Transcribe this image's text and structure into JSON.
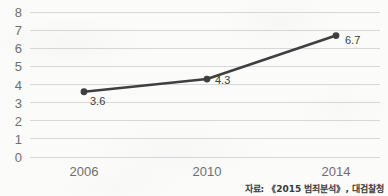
{
  "chart_data": {
    "type": "line",
    "title": "",
    "subtitle": "",
    "xlabel": "",
    "ylabel": "",
    "categories": [
      "2006",
      "2010",
      "2014"
    ],
    "values": [
      3.6,
      4.3,
      6.7
    ],
    "point_labels": [
      "3.6",
      "4.3",
      "6.7"
    ],
    "ylim": [
      0,
      8
    ],
    "ytick_labels": [
      "0",
      "1",
      "2",
      "3",
      "4",
      "5",
      "6",
      "7",
      "8"
    ],
    "ytick_values": [
      0,
      1,
      2,
      3,
      4,
      5,
      6,
      7,
      8
    ],
    "grid": true,
    "grid_axis": "y",
    "legend": false,
    "legend_position": "none",
    "series": [
      {
        "name": "",
        "values": [
          3.6,
          4.3,
          6.7
        ]
      }
    ],
    "annotations": [
      "자료: 《2015 범죄분석》, 대검찰청"
    ]
  },
  "style": {
    "line_color": "#3f3f42",
    "marker_color": "#3f3f42",
    "grid_color": "#d8d8da",
    "tick_label_color": "#6f6f70",
    "data_label_color": "#3c3c3e",
    "background_color": "#fbfbfa"
  },
  "source": {
    "text": "자료: 《2015 범죄분석》, 대검찰청"
  }
}
